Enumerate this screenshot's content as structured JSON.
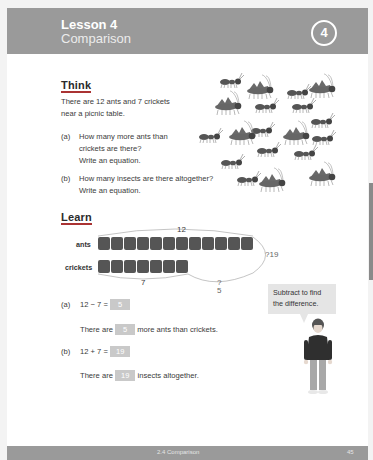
{
  "header": {
    "lesson_number": "Lesson 4",
    "lesson_title": "Comparison",
    "badge": "4"
  },
  "think": {
    "title": "Think",
    "intro_line1": "There are 12 ants and 7 crickets",
    "intro_line2": "near a picnic table.",
    "qa_label": "(a)",
    "qa_line1": "How many more ants than",
    "qa_line2": "crickets are there?",
    "qa_line3": "Write an equation.",
    "qb_label": "(b)",
    "qb_line1": "How many insects are there altogether?",
    "qb_line2": "Write an equation.",
    "picture": {
      "ants": 12,
      "crickets": 7
    }
  },
  "learn": {
    "title": "Learn",
    "diagram": {
      "row1_label": "ants",
      "row2_label": "crickets",
      "ants_count": 12,
      "crickets_count": 7,
      "top_brace": "12",
      "bottom_brace": "7",
      "total_label": "?19",
      "diff_q": "?",
      "diff_value": "5"
    },
    "a_label": "(a)",
    "a_equation": "12 − 7 =",
    "a_answer": "5",
    "a_sentence_pre": "There are",
    "a_sentence_ans": "5",
    "a_sentence_post": "more ants than crickets.",
    "b_label": "(b)",
    "b_equation": "12 + 7 =",
    "b_answer": "19",
    "b_sentence_pre": "There are",
    "b_sentence_ans": "19",
    "b_sentence_post": "insects altogether.",
    "bubble": {
      "line1": "Subtract to find",
      "line2": "the difference."
    }
  },
  "footer": {
    "section": "2.4 Comparison",
    "page": "45"
  }
}
